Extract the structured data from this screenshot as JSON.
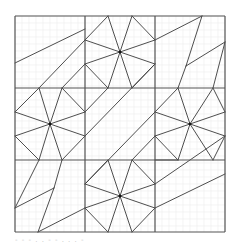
{
  "diagram": {
    "type": "geometric-tiling-pattern",
    "frame": {
      "x": 15,
      "y": 16,
      "width": 210,
      "height": 216
    },
    "grid": {
      "cols": 3,
      "rows": 3,
      "col_edges": [
        15,
        85,
        155,
        225
      ],
      "row_edges": [
        16,
        88,
        160,
        232
      ],
      "minor_step": 7
    },
    "colors": {
      "background": "#ffffff",
      "minor_grid": "#ececec",
      "major_line": "#555555",
      "shape_line": "#3a3a3a",
      "caption": "#c8c8c8"
    },
    "stars": [
      {
        "name": "star-top-center",
        "center": [
          120,
          52
        ]
      },
      {
        "name": "star-middle-left",
        "center": [
          50,
          124
        ]
      },
      {
        "name": "star-middle-right",
        "center": [
          190,
          124
        ]
      },
      {
        "name": "star-bottom-center",
        "center": [
          120,
          196
        ]
      }
    ],
    "segments": [
      [
        15,
        63,
        85,
        29
      ],
      [
        85,
        40,
        108,
        16
      ],
      [
        108,
        16,
        120,
        52
      ],
      [
        85,
        40,
        120,
        52
      ],
      [
        120,
        52,
        132,
        16
      ],
      [
        132,
        16,
        155,
        40
      ],
      [
        120,
        52,
        155,
        40
      ],
      [
        120,
        52,
        155,
        64
      ],
      [
        155,
        64,
        132,
        88
      ],
      [
        120,
        52,
        132,
        88
      ],
      [
        120,
        52,
        108,
        88
      ],
      [
        108,
        88,
        85,
        64
      ],
      [
        120,
        52,
        85,
        64
      ],
      [
        85,
        40,
        39,
        88
      ],
      [
        85,
        64,
        62,
        88
      ],
      [
        155,
        40,
        202,
        16
      ],
      [
        202,
        16,
        186,
        66
      ],
      [
        186,
        66,
        225,
        42
      ],
      [
        225,
        42,
        213,
        88
      ],
      [
        186,
        66,
        178,
        88
      ],
      [
        15,
        112,
        39,
        88
      ],
      [
        39,
        88,
        50,
        124
      ],
      [
        50,
        124,
        62,
        88
      ],
      [
        62,
        88,
        85,
        112
      ],
      [
        50,
        124,
        85,
        112
      ],
      [
        50,
        124,
        85,
        136
      ],
      [
        85,
        136,
        62,
        160
      ],
      [
        50,
        124,
        62,
        160
      ],
      [
        50,
        124,
        39,
        160
      ],
      [
        39,
        160,
        15,
        136
      ],
      [
        50,
        124,
        15,
        136
      ],
      [
        50,
        124,
        15,
        112
      ],
      [
        85,
        112,
        108,
        88
      ],
      [
        85,
        136,
        155,
        64
      ],
      [
        155,
        112,
        85,
        184
      ],
      [
        155,
        136,
        132,
        160
      ],
      [
        155,
        112,
        178,
        88
      ],
      [
        178,
        88,
        190,
        124
      ],
      [
        190,
        124,
        213,
        88
      ],
      [
        213,
        88,
        225,
        112
      ],
      [
        190,
        124,
        225,
        112
      ],
      [
        190,
        124,
        225,
        136
      ],
      [
        225,
        136,
        213,
        160
      ],
      [
        190,
        124,
        213,
        160
      ],
      [
        190,
        124,
        178,
        160
      ],
      [
        178,
        160,
        155,
        136
      ],
      [
        190,
        124,
        155,
        136
      ],
      [
        190,
        124,
        155,
        112
      ],
      [
        39,
        160,
        15,
        208
      ],
      [
        15,
        208,
        54,
        188
      ],
      [
        54,
        188,
        38,
        232
      ],
      [
        62,
        160,
        54,
        188
      ],
      [
        38,
        232,
        85,
        208
      ],
      [
        108,
        160,
        120,
        196
      ],
      [
        120,
        196,
        132,
        160
      ],
      [
        132,
        160,
        155,
        184
      ],
      [
        120,
        196,
        155,
        184
      ],
      [
        120,
        196,
        155,
        208
      ],
      [
        155,
        208,
        132,
        232
      ],
      [
        120,
        196,
        132,
        232
      ],
      [
        120,
        196,
        108,
        232
      ],
      [
        108,
        232,
        85,
        208
      ],
      [
        120,
        196,
        85,
        208
      ],
      [
        120,
        196,
        85,
        184
      ],
      [
        85,
        184,
        108,
        160
      ],
      [
        155,
        184,
        225,
        136
      ],
      [
        155,
        208,
        225,
        174
      ],
      [
        155,
        160,
        178,
        160
      ]
    ]
  },
  "caption": {
    "text": "- - -  .  .  -  -   .  .   .  -"
  }
}
